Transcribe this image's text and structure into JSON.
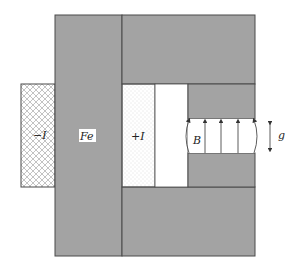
{
  "diagram": {
    "labels": {
      "minus_current": "−I",
      "iron": "Fe",
      "plus_current": "+I",
      "field": "B",
      "gap": "g"
    },
    "colors": {
      "iron": "#a3a3a3",
      "outline": "#4a4a4a",
      "hatch": "#9a9a9a",
      "dots": "#b5b5b5",
      "arrow": "#333333",
      "background": "#ffffff"
    },
    "field_arrow_count": 5
  }
}
